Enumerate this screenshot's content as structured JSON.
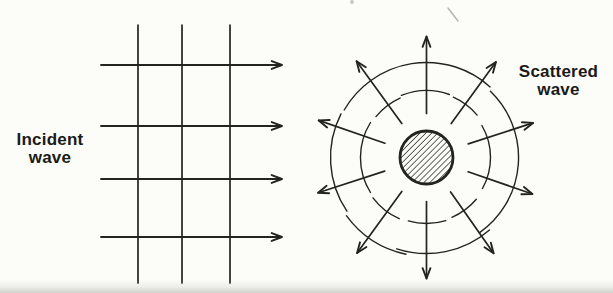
{
  "colors": {
    "background": "#fcfcf9",
    "ink": "#24241f",
    "label_text": "#1a1a17",
    "artifact_gray": "#b5b5ae"
  },
  "incident_wave": {
    "label": {
      "line1": "Incident",
      "line2": "wave"
    },
    "grid": {
      "vertical_lines_x": [
        138,
        182,
        230
      ],
      "vertical_line_top": 25,
      "vertical_line_bottom": 283,
      "ray_lines_y": [
        65,
        126,
        179,
        237
      ],
      "ray_start_x": 101,
      "ray_tip_x": 282
    }
  },
  "scattered_wave": {
    "label": {
      "line1": "Scattered",
      "line2": "wave"
    },
    "center_x": 426.5,
    "center_y": 157.5,
    "obstacle_radius": 26.5,
    "radial_arrows": [
      {
        "angle_deg": 18,
        "inner_r": 44,
        "tip_r": 112
      },
      {
        "angle_deg": 54,
        "inner_r": 42,
        "tip_r": 118
      },
      {
        "angle_deg": 90,
        "inner_r": 44,
        "tip_r": 121
      },
      {
        "angle_deg": 126,
        "inner_r": 42,
        "tip_r": 119
      },
      {
        "angle_deg": 161,
        "inner_r": 44,
        "tip_r": 114
      },
      {
        "angle_deg": 198,
        "inner_r": 44,
        "tip_r": 114
      },
      {
        "angle_deg": 234,
        "inner_r": 42,
        "tip_r": 118
      },
      {
        "angle_deg": 270,
        "inner_r": 44,
        "tip_r": 121
      },
      {
        "angle_deg": 305,
        "inner_r": 42,
        "tip_r": 117
      },
      {
        "angle_deg": 341,
        "inner_r": 44,
        "tip_r": 112
      }
    ],
    "wavefront_arcs": [
      {
        "ring": "inner",
        "r": 66,
        "from_deg": 40,
        "to_deg": 66
      },
      {
        "ring": "inner",
        "r": 67,
        "from_deg": 70,
        "to_deg": 112
      },
      {
        "ring": "inner",
        "r": 65,
        "from_deg": 114,
        "to_deg": 141
      },
      {
        "ring": "inner",
        "r": 66,
        "from_deg": 148,
        "to_deg": 212
      },
      {
        "ring": "inner",
        "r": 67,
        "from_deg": 217,
        "to_deg": 246
      },
      {
        "ring": "inner",
        "r": 66,
        "from_deg": 254,
        "to_deg": 287
      },
      {
        "ring": "inner",
        "r": 65,
        "from_deg": 293,
        "to_deg": 320
      },
      {
        "ring": "inner",
        "r": 64,
        "from_deg": -29,
        "to_deg": 30
      },
      {
        "ring": "outer",
        "r": 95,
        "from_deg": 48,
        "to_deg": 150
      },
      {
        "ring": "outer",
        "r": 96,
        "from_deg": 153,
        "to_deg": 214
      },
      {
        "ring": "outer",
        "r": 99,
        "from_deg": 216,
        "to_deg": 258
      },
      {
        "ring": "outer",
        "r": 96,
        "from_deg": 252,
        "to_deg": 311
      },
      {
        "ring": "outer",
        "r": 92,
        "from_deg": -55,
        "to_deg": 46
      }
    ]
  },
  "artifacts": {
    "stray_line": {
      "x1": 448,
      "y1": 8,
      "x2": 458,
      "y2": 21
    },
    "smudge": {
      "x": 352,
      "y": 2
    }
  }
}
